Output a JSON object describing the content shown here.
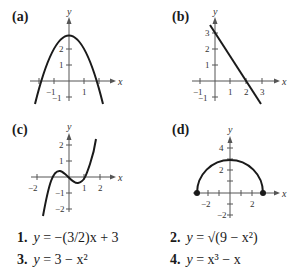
{
  "panels": [
    {
      "label": "(a)",
      "axis_x": "x",
      "axis_y": "y",
      "x_ticks": [
        "−1",
        "1"
      ],
      "y_ticks": [
        "−1",
        "1",
        "2"
      ]
    },
    {
      "label": "(b)",
      "axis_x": "x",
      "axis_y": "y",
      "x_ticks": [
        "−1",
        "1",
        "2",
        "3"
      ],
      "y_ticks": [
        "−1",
        "1",
        "2",
        "3"
      ]
    },
    {
      "label": "(c)",
      "axis_x": "x",
      "axis_y": "y",
      "x_ticks": [
        "−2",
        "1",
        "2"
      ],
      "y_ticks": [
        "−2",
        "−1",
        "1",
        "2"
      ]
    },
    {
      "label": "(d)",
      "axis_x": "x",
      "axis_y": "y",
      "x_ticks": [
        "−2",
        "2"
      ],
      "y_ticks": [
        "−2",
        "2",
        "4"
      ]
    }
  ],
  "equations": [
    {
      "num": "1.",
      "lhs": "y",
      "rhs": "= −(3/2)x + 3"
    },
    {
      "num": "2.",
      "lhs": "y",
      "rhs": "= √(9 − x²)"
    },
    {
      "num": "3.",
      "lhs": "y",
      "rhs": "= 3 − x²"
    },
    {
      "num": "4.",
      "lhs": "y",
      "rhs": "= x³ − x"
    }
  ],
  "colors": {
    "curve": "#1a1a1a",
    "axis": "#555555"
  }
}
